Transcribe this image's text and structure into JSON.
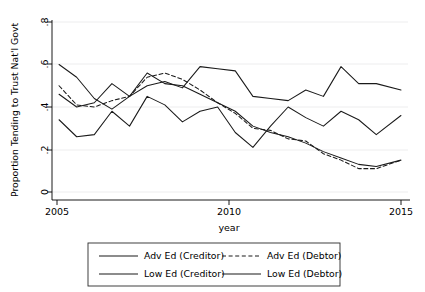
{
  "chart_data": {
    "type": "line",
    "title": "",
    "xlabel": "year",
    "ylabel": "Proportion Tending to Trust Nat'l Govt",
    "xlim": [
      2004.8,
      2014.9
    ],
    "ylim": [
      0,
      0.8
    ],
    "xticks": [
      2005,
      2010,
      2015
    ],
    "xticklabels": [
      "2005",
      "2010",
      "2015"
    ],
    "yticks": [
      0,
      0.2,
      0.4,
      0.6,
      0.8
    ],
    "yticklabels": [
      "0",
      ".2",
      ".4",
      ".6",
      ".8"
    ],
    "grid": "horizontal",
    "legend_position": "below",
    "x": [
      2005.0,
      2005.5,
      2006.0,
      2006.5,
      2007.0,
      2007.5,
      2008.0,
      2008.5,
      2009.0,
      2009.5,
      2010.0,
      2010.5,
      2011.0,
      2011.5,
      2012.0,
      2012.5,
      2013.0,
      2013.5,
      2014.0,
      2014.7
    ],
    "series": [
      {
        "name": "Adv Ed (Creditor)",
        "style": "solid",
        "color": "#1a1a1a",
        "values": [
          0.46,
          0.4,
          0.42,
          0.51,
          0.45,
          0.5,
          0.52,
          0.49,
          0.59,
          0.58,
          0.57,
          0.45,
          0.44,
          0.43,
          0.48,
          0.45,
          0.59,
          0.51,
          0.51,
          0.48
        ]
      },
      {
        "name": "Adv Ed (Debtor)",
        "style": "dashed",
        "color": "#1a1a1a",
        "values": [
          0.5,
          0.41,
          0.4,
          0.43,
          0.45,
          0.54,
          0.56,
          0.53,
          0.48,
          0.42,
          0.37,
          0.3,
          0.29,
          0.25,
          0.24,
          0.18,
          0.15,
          0.11,
          0.11,
          0.15
        ]
      },
      {
        "name": "Low Ed (Creditor)",
        "style": "solid",
        "color": "#1a1a1a",
        "values": [
          0.6,
          0.54,
          0.44,
          0.39,
          0.45,
          0.56,
          0.51,
          0.5,
          0.46,
          0.42,
          0.38,
          0.31,
          0.28,
          0.26,
          0.23,
          0.19,
          0.16,
          0.13,
          0.12,
          0.15
        ]
      },
      {
        "name": "Low Ed (Debtor)",
        "style": "solid",
        "color": "#1a1a1a",
        "values": [
          0.34,
          0.26,
          0.27,
          0.38,
          0.31,
          0.45,
          0.41,
          0.33,
          0.38,
          0.4,
          0.28,
          0.21,
          0.31,
          0.4,
          0.35,
          0.31,
          0.38,
          0.34,
          0.27,
          0.36
        ]
      }
    ]
  },
  "legend": {
    "entries": [
      {
        "label": "Adv Ed (Creditor)",
        "style": "solid"
      },
      {
        "label": "Adv Ed (Debtor)",
        "style": "dashed"
      },
      {
        "label": "Low Ed (Creditor)",
        "style": "solid"
      },
      {
        "label": "Low Ed (Debtor)",
        "style": "solid"
      }
    ]
  }
}
